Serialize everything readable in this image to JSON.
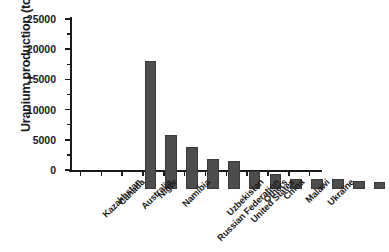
{
  "chart_data": {
    "type": "bar",
    "title": "",
    "subtitle": "",
    "xlabel": "",
    "ylabel": "Uranium production (tonnes)",
    "categories": [
      "Kazakhstan",
      "Canada",
      "Australia",
      "Niger",
      "Namibia",
      "Russian Federation",
      "Uzbekistan",
      "United States",
      "Others",
      "China",
      "Malawi",
      "Ukraine"
    ],
    "values": [
      21200,
      9000,
      7000,
      4900,
      4700,
      3000,
      2500,
      1700,
      1700,
      1600,
      1300,
      1200
    ],
    "ylim": [
      0,
      25000
    ],
    "ytick_values": [
      0,
      5000,
      10000,
      15000,
      20000,
      25000
    ],
    "ytick_labels": [
      "0",
      "5000",
      "10000",
      "15000",
      "20000",
      "25000"
    ],
    "y_minor_tick_interval": 2500,
    "grid": false,
    "legend": false,
    "legend_position": "none",
    "bar_color": "#4d4d4d",
    "axis_color": "#1a1a1a",
    "background_color": "#ffffff",
    "x_tick_label_rotation": -45
  }
}
